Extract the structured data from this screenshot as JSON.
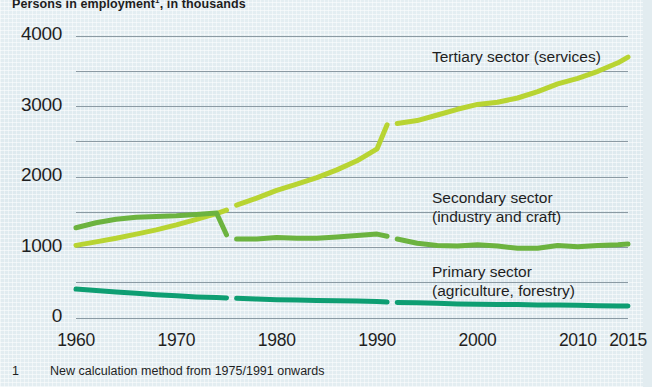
{
  "chart_data": {
    "type": "line",
    "title_main": "Persons in employment",
    "title_superscript": "1",
    "title_tail": ", in thousands",
    "xlabel": "",
    "ylabel": "",
    "xlim": [
      1960,
      2015
    ],
    "ylim": [
      0,
      4000
    ],
    "grid": true,
    "grid_major_step": 1000,
    "grid_minor_step": 500,
    "legend_position": "inline-right",
    "xticks": [
      "1960",
      "1970",
      "1980",
      "1990",
      "2000",
      "2010",
      "2015"
    ],
    "xtick_values": [
      1960,
      1970,
      1980,
      1990,
      2000,
      2010,
      2015
    ],
    "yticks": [
      "0",
      "1000",
      "2000",
      "3000",
      "4000"
    ],
    "ytick_values": [
      0,
      1000,
      2000,
      3000,
      4000
    ],
    "breaks": [
      1975,
      1991
    ],
    "series": [
      {
        "name": "Tertiary sector (services)",
        "label_line1": "Tertiary sector (services)",
        "label_line2": "",
        "color": "#b8d432",
        "x": [
          1960,
          1962,
          1964,
          1966,
          1968,
          1970,
          1972,
          1974,
          1975,
          1976,
          1978,
          1980,
          1982,
          1984,
          1986,
          1988,
          1990,
          1991,
          1992,
          1994,
          1996,
          1998,
          2000,
          2002,
          2004,
          2006,
          2008,
          2010,
          2012,
          2014,
          2015
        ],
        "values": [
          1030,
          1080,
          1130,
          1190,
          1250,
          1320,
          1400,
          1480,
          1530,
          1600,
          1700,
          1810,
          1900,
          1990,
          2100,
          2230,
          2400,
          2740,
          2760,
          2800,
          2880,
          2960,
          3030,
          3060,
          3120,
          3210,
          3320,
          3400,
          3500,
          3620,
          3700
        ]
      },
      {
        "name": "Secondary sector (industry and craft)",
        "label_line1": "Secondary sector",
        "label_line2": "(industry and craft)",
        "color": "#6cb33f",
        "x": [
          1960,
          1962,
          1964,
          1966,
          1968,
          1970,
          1972,
          1974,
          1975,
          1976,
          1978,
          1980,
          1982,
          1984,
          1986,
          1988,
          1990,
          1991,
          1992,
          1994,
          1996,
          1998,
          2000,
          2002,
          2004,
          2006,
          2008,
          2010,
          2012,
          2014,
          2015
        ],
        "values": [
          1280,
          1350,
          1400,
          1430,
          1440,
          1450,
          1470,
          1490,
          1180,
          1120,
          1120,
          1140,
          1130,
          1130,
          1150,
          1170,
          1190,
          1160,
          1120,
          1060,
          1030,
          1020,
          1040,
          1020,
          990,
          990,
          1030,
          1010,
          1030,
          1040,
          1050
        ]
      },
      {
        "name": "Primary sector (agriculture, forestry)",
        "label_line1": "Primary sector",
        "label_line2": "(agriculture, forestry)",
        "color": "#0e9e72",
        "x": [
          1960,
          1962,
          1964,
          1966,
          1968,
          1970,
          1972,
          1974,
          1975,
          1976,
          1978,
          1980,
          1982,
          1984,
          1986,
          1988,
          1990,
          1991,
          1992,
          1994,
          1996,
          1998,
          2000,
          2002,
          2004,
          2006,
          2008,
          2010,
          2012,
          2014,
          2015
        ],
        "values": [
          410,
          390,
          370,
          350,
          330,
          315,
          300,
          290,
          285,
          280,
          270,
          260,
          255,
          250,
          245,
          240,
          235,
          225,
          220,
          215,
          210,
          200,
          195,
          190,
          190,
          185,
          185,
          180,
          175,
          172,
          170
        ]
      }
    ]
  },
  "footnote": {
    "marker": "1",
    "text": "New calculation method from 1975/1991 onwards"
  },
  "colors": {
    "background": "#dfeaef",
    "gridline": "#8b9aa3",
    "text": "#1f1f1f",
    "tertiary": "#b8d432",
    "secondary": "#6cb33f",
    "primary": "#0e9e72"
  },
  "labels": {
    "tertiary_pos": {
      "x": 432,
      "y": 47
    },
    "secondary_pos": {
      "x": 432,
      "y": 188
    },
    "primary_pos": {
      "x": 432,
      "y": 262
    }
  }
}
